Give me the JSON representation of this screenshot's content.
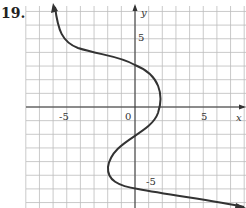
{
  "problem_number": "19.",
  "chart_data": {
    "type": "line",
    "title": "",
    "xlabel": "x",
    "ylabel": "y",
    "xlim": [
      -8,
      8
    ],
    "ylim": [
      -7,
      7
    ],
    "grid": true,
    "x_tick_labels": [
      "-5",
      "0",
      "5"
    ],
    "y_tick_labels": [
      "5",
      "-5"
    ],
    "series": [
      {
        "name": "curve",
        "points": [
          [
            -5.8,
            7.5
          ],
          [
            -5.5,
            5.8
          ],
          [
            -4.5,
            4.5
          ],
          [
            -2,
            3.6
          ],
          [
            0,
            3.1
          ],
          [
            1.5,
            2
          ],
          [
            2,
            0.8
          ],
          [
            1.6,
            -0.6
          ],
          [
            0,
            -2.2
          ],
          [
            -1.8,
            -3.6
          ],
          [
            -2,
            -4.5
          ],
          [
            -1.2,
            -5.6
          ],
          [
            0,
            -6
          ],
          [
            3,
            -6.6
          ],
          [
            6,
            -7.2
          ],
          [
            8,
            -7.6
          ]
        ],
        "arrows": "both"
      }
    ]
  }
}
